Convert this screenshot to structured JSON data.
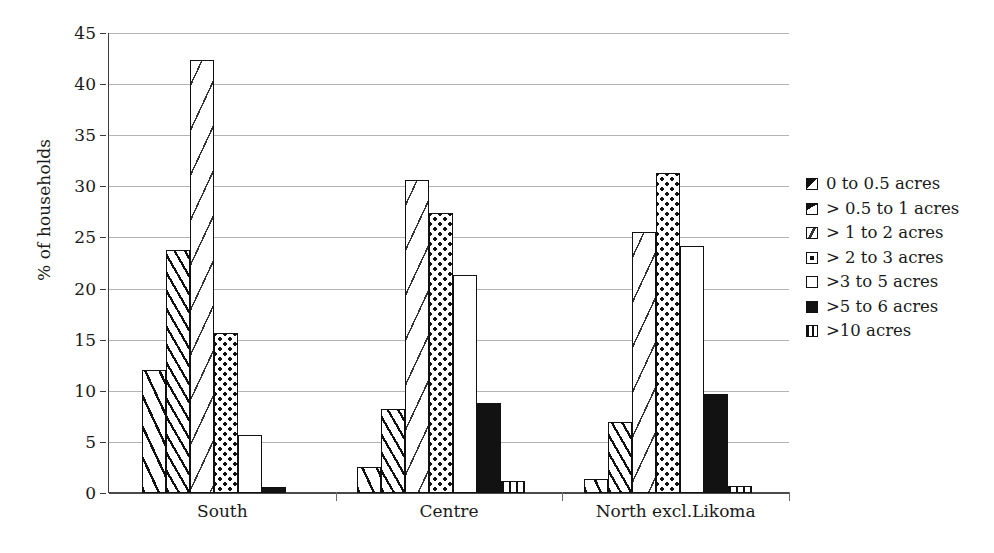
{
  "chart_data": {
    "type": "bar",
    "title": "",
    "subtitle": "",
    "xlabel": "",
    "ylabel": "% of households",
    "ylim": [
      0,
      45
    ],
    "yticks": [
      0,
      5,
      10,
      15,
      20,
      25,
      30,
      35,
      40,
      45
    ],
    "ytick_labels": [
      "0",
      "5",
      "10",
      "15",
      "20",
      "25",
      "30",
      "35",
      "40",
      "45"
    ],
    "grid": true,
    "legend_position": "right",
    "categories": [
      "South",
      "Centre",
      "North excl.Likoma"
    ],
    "series": [
      {
        "name": "0 to 0.5 acres",
        "pattern": "diagonal-hatch-wide",
        "values": [
          12.0,
          2.5,
          1.4
        ]
      },
      {
        "name": "> 0.5 to 1 acres",
        "pattern": "diagonal-hatch-dense",
        "values": [
          23.8,
          8.2,
          6.9
        ]
      },
      {
        "name": "> 1 to 2 acres",
        "pattern": "sparse-dashes",
        "values": [
          42.4,
          30.6,
          25.5
        ]
      },
      {
        "name": "> 2 to 3 acres",
        "pattern": "dot-grid",
        "values": [
          15.7,
          27.4,
          31.3
        ]
      },
      {
        "name": ">3 to 5 acres",
        "pattern": "blank-white",
        "values": [
          5.7,
          21.3,
          24.2
        ]
      },
      {
        "name": ">5 to 6 acres",
        "pattern": "solid-black",
        "values": [
          0.6,
          8.8,
          9.7
        ]
      },
      {
        "name": ">10 acres",
        "pattern": "vertical-lines",
        "values": [
          null,
          1.2,
          0.7
        ]
      }
    ]
  },
  "legend": {
    "items": [
      {
        "label": "0 to 0.5 acres",
        "swatch": "diagonal-hatch-wide"
      },
      {
        "label": "> 0.5 to 1 acres",
        "swatch": "diagonal-hatch-dense"
      },
      {
        "label": "> 1 to 2 acres",
        "swatch": "sparse-dashes"
      },
      {
        "label": "> 2 to 3 acres",
        "swatch": "dot-grid"
      },
      {
        "label": ">3 to 5 acres",
        "swatch": "blank-white"
      },
      {
        "label": ">5 to 6 acres",
        "swatch": "solid-black"
      },
      {
        "label": ">10 acres",
        "swatch": "vertical-lines"
      }
    ]
  },
  "colors": {
    "background": "#ffffff",
    "ink": "#111111",
    "gridline": "#b4b4b4",
    "axis": "#3a3a3a"
  }
}
